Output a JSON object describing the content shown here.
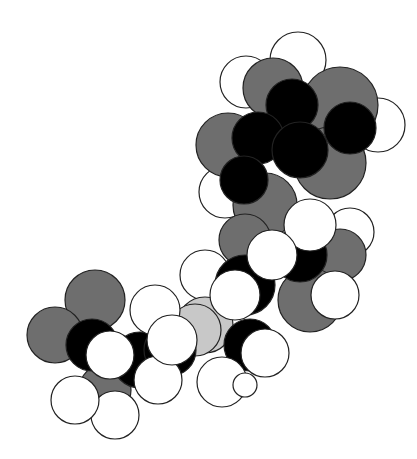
{
  "figure": {
    "type": "space-filling molecular model",
    "background": "#ffffff",
    "colors": {
      "hydrogen": "#ffffff",
      "dark_atom": "#000000",
      "gray_atom": "#6e6e6e",
      "light_atom": "#c8c8c8",
      "outline": "#222222"
    },
    "atoms": [
      {
        "x": 298,
        "y": 60,
        "r": 28,
        "c": "hydrogen"
      },
      {
        "x": 246,
        "y": 82,
        "r": 26,
        "c": "hydrogen"
      },
      {
        "x": 378,
        "y": 125,
        "r": 27,
        "c": "hydrogen"
      },
      {
        "x": 225,
        "y": 192,
        "r": 26,
        "c": "hydrogen"
      },
      {
        "x": 273,
        "y": 88,
        "r": 30,
        "c": "gray_atom"
      },
      {
        "x": 340,
        "y": 105,
        "r": 38,
        "c": "gray_atom"
      },
      {
        "x": 228,
        "y": 145,
        "r": 32,
        "c": "gray_atom"
      },
      {
        "x": 330,
        "y": 163,
        "r": 36,
        "c": "gray_atom"
      },
      {
        "x": 265,
        "y": 205,
        "r": 32,
        "c": "gray_atom"
      },
      {
        "x": 292,
        "y": 105,
        "r": 26,
        "c": "dark_atom"
      },
      {
        "x": 350,
        "y": 128,
        "r": 26,
        "c": "dark_atom"
      },
      {
        "x": 258,
        "y": 138,
        "r": 26,
        "c": "dark_atom"
      },
      {
        "x": 300,
        "y": 150,
        "r": 28,
        "c": "dark_atom"
      },
      {
        "x": 244,
        "y": 180,
        "r": 24,
        "c": "dark_atom"
      },
      {
        "x": 350,
        "y": 232,
        "r": 24,
        "c": "hydrogen"
      },
      {
        "x": 245,
        "y": 240,
        "r": 26,
        "c": "gray_atom"
      },
      {
        "x": 340,
        "y": 255,
        "r": 26,
        "c": "gray_atom"
      },
      {
        "x": 310,
        "y": 300,
        "r": 32,
        "c": "gray_atom"
      },
      {
        "x": 205,
        "y": 275,
        "r": 25,
        "c": "hydrogen"
      },
      {
        "x": 300,
        "y": 255,
        "r": 27,
        "c": "dark_atom"
      },
      {
        "x": 245,
        "y": 285,
        "r": 30,
        "c": "dark_atom"
      },
      {
        "x": 205,
        "y": 325,
        "r": 28,
        "c": "light_atom"
      },
      {
        "x": 195,
        "y": 330,
        "r": 26,
        "c": "light_atom"
      },
      {
        "x": 250,
        "y": 345,
        "r": 26,
        "c": "dark_atom"
      },
      {
        "x": 310,
        "y": 225,
        "r": 26,
        "c": "hydrogen"
      },
      {
        "x": 335,
        "y": 295,
        "r": 24,
        "c": "hydrogen"
      },
      {
        "x": 272,
        "y": 255,
        "r": 25,
        "c": "hydrogen"
      },
      {
        "x": 235,
        "y": 295,
        "r": 25,
        "c": "hydrogen"
      },
      {
        "x": 265,
        "y": 353,
        "r": 24,
        "c": "hydrogen"
      },
      {
        "x": 222,
        "y": 382,
        "r": 25,
        "c": "hydrogen"
      },
      {
        "x": 245,
        "y": 385,
        "r": 12,
        "c": "hydrogen"
      },
      {
        "x": 95,
        "y": 300,
        "r": 30,
        "c": "gray_atom"
      },
      {
        "x": 55,
        "y": 335,
        "r": 28,
        "c": "gray_atom"
      },
      {
        "x": 105,
        "y": 390,
        "r": 26,
        "c": "gray_atom"
      },
      {
        "x": 92,
        "y": 345,
        "r": 26,
        "c": "dark_atom"
      },
      {
        "x": 140,
        "y": 360,
        "r": 28,
        "c": "dark_atom"
      },
      {
        "x": 170,
        "y": 350,
        "r": 26,
        "c": "dark_atom"
      },
      {
        "x": 155,
        "y": 310,
        "r": 25,
        "c": "hydrogen"
      },
      {
        "x": 158,
        "y": 380,
        "r": 24,
        "c": "hydrogen"
      },
      {
        "x": 115,
        "y": 415,
        "r": 24,
        "c": "hydrogen"
      },
      {
        "x": 75,
        "y": 400,
        "r": 24,
        "c": "hydrogen"
      },
      {
        "x": 110,
        "y": 355,
        "r": 24,
        "c": "hydrogen"
      },
      {
        "x": 172,
        "y": 340,
        "r": 25,
        "c": "hydrogen"
      }
    ]
  }
}
